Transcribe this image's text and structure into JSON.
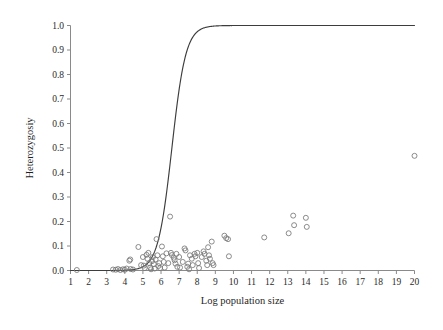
{
  "chart_data": {
    "type": "scatter",
    "title": "",
    "xlabel": "Log population size",
    "ylabel": "Heterozygosiy",
    "xlim": [
      1,
      20
    ],
    "ylim": [
      0.0,
      1.0
    ],
    "grid": false,
    "legend": null,
    "xticks": [
      1,
      2,
      3,
      4,
      5,
      6,
      7,
      8,
      9,
      10,
      11,
      12,
      13,
      14,
      15,
      16,
      17,
      18,
      19,
      20
    ],
    "xtick_labels": [
      "1",
      "2",
      "3",
      "4",
      "5",
      "6",
      "7",
      "8",
      "9",
      "10",
      "11",
      "12",
      "13",
      "14",
      "15",
      "16",
      "17",
      "18",
      "19",
      "20"
    ],
    "yticks": [
      0.0,
      0.1,
      0.2,
      0.3,
      0.4,
      0.5,
      0.6,
      0.7,
      0.8,
      0.9,
      1.0
    ],
    "ytick_labels": [
      "0.0",
      "0.1",
      "0.2",
      "0.3",
      "0.4",
      "0.5",
      "0.6",
      "0.7",
      "0.8",
      "0.9",
      "1.0"
    ],
    "marker": "open-circle",
    "marker_color": "#777777",
    "curve_color": "#3d3d3d",
    "series": [
      {
        "name": "observed heterozygosity",
        "type": "scatter",
        "points": [
          [
            1.35,
            0.002
          ],
          [
            3.35,
            0.004
          ],
          [
            3.5,
            0.003
          ],
          [
            3.62,
            0.006
          ],
          [
            3.75,
            0.002
          ],
          [
            3.9,
            0.005
          ],
          [
            4.0,
            0.003
          ],
          [
            4.1,
            0.008
          ],
          [
            4.25,
            0.04
          ],
          [
            4.3,
            0.045
          ],
          [
            4.32,
            0.006
          ],
          [
            4.45,
            0.004
          ],
          [
            4.75,
            0.096
          ],
          [
            4.9,
            0.022
          ],
          [
            5.0,
            0.055
          ],
          [
            5.05,
            0.02
          ],
          [
            5.1,
            0.01
          ],
          [
            5.2,
            0.064
          ],
          [
            5.25,
            0.048
          ],
          [
            5.3,
            0.072
          ],
          [
            5.35,
            0.03
          ],
          [
            5.4,
            0.012
          ],
          [
            5.45,
            0.005
          ],
          [
            5.5,
            0.038
          ],
          [
            5.55,
            0.055
          ],
          [
            5.6,
            0.026
          ],
          [
            5.65,
            0.008
          ],
          [
            5.7,
            0.045
          ],
          [
            5.75,
            0.128
          ],
          [
            5.8,
            0.062
          ],
          [
            5.85,
            0.018
          ],
          [
            5.9,
            0.03
          ],
          [
            5.95,
            0.01
          ],
          [
            6.05,
            0.098
          ],
          [
            6.1,
            0.058
          ],
          [
            6.15,
            0.035
          ],
          [
            6.2,
            0.012
          ],
          [
            6.3,
            0.07
          ],
          [
            6.4,
            0.03
          ],
          [
            6.5,
            0.22
          ],
          [
            6.55,
            0.072
          ],
          [
            6.6,
            0.063
          ],
          [
            6.7,
            0.052
          ],
          [
            6.75,
            0.042
          ],
          [
            6.8,
            0.028
          ],
          [
            6.85,
            0.068
          ],
          [
            6.9,
            0.015
          ],
          [
            7.0,
            0.055
          ],
          [
            7.05,
            0.012
          ],
          [
            7.2,
            0.035
          ],
          [
            7.3,
            0.09
          ],
          [
            7.35,
            0.082
          ],
          [
            7.45,
            0.015
          ],
          [
            7.5,
            0.028
          ],
          [
            7.55,
            0.005
          ],
          [
            7.6,
            0.062
          ],
          [
            7.7,
            0.048
          ],
          [
            7.75,
            0.022
          ],
          [
            7.85,
            0.068
          ],
          [
            7.9,
            0.058
          ],
          [
            8.0,
            0.072
          ],
          [
            8.05,
            0.03
          ],
          [
            8.1,
            0.01
          ],
          [
            8.25,
            0.055
          ],
          [
            8.35,
            0.078
          ],
          [
            8.4,
            0.068
          ],
          [
            8.5,
            0.04
          ],
          [
            8.55,
            0.022
          ],
          [
            8.6,
            0.095
          ],
          [
            8.65,
            0.062
          ],
          [
            8.7,
            0.048
          ],
          [
            8.8,
            0.118
          ],
          [
            8.85,
            0.03
          ],
          [
            8.9,
            0.022
          ],
          [
            9.5,
            0.142
          ],
          [
            9.6,
            0.132
          ],
          [
            9.7,
            0.128
          ],
          [
            9.75,
            0.058
          ],
          [
            11.7,
            0.135
          ],
          [
            13.05,
            0.152
          ],
          [
            13.3,
            0.224
          ],
          [
            13.35,
            0.185
          ],
          [
            14.0,
            0.215
          ],
          [
            14.05,
            0.178
          ],
          [
            20.0,
            0.468
          ]
        ]
      },
      {
        "name": "fitted logistic curve",
        "type": "line",
        "model": "logistic",
        "midpoint_x": 6.6,
        "steepness": 2.6,
        "asymptote": 1.0
      }
    ],
    "annotations": []
  }
}
